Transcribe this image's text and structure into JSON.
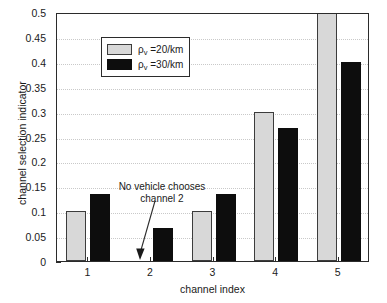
{
  "chart_data": {
    "type": "bar",
    "title": "",
    "xlabel": "channel index",
    "ylabel": "channel selection indicator",
    "categories": [
      "1",
      "2",
      "3",
      "4",
      "5"
    ],
    "series": [
      {
        "name": "rho_v =20/km",
        "values": [
          0.1,
          0.0,
          0.1,
          0.3,
          0.5
        ],
        "color": "#d8d8d8"
      },
      {
        "name": "rho_v =30/km",
        "values": [
          0.135,
          0.067,
          0.135,
          0.267,
          0.4
        ],
        "color": "#0d0d0d"
      }
    ],
    "ylim": [
      0,
      0.5
    ],
    "yticks": [
      "0",
      "0.05",
      "0.1",
      "0.15",
      "0.2",
      "0.25",
      "0.3",
      "0.35",
      "0.4",
      "0.45",
      "0.5"
    ],
    "ytick_values": [
      0,
      0.05,
      0.1,
      0.15,
      0.2,
      0.25,
      0.3,
      0.35,
      0.4,
      0.45,
      0.5
    ],
    "grid": true,
    "legend_position": "upper left",
    "annotations": [
      {
        "text_line1": "No vehicle chooses",
        "text_line2": "channel 2",
        "points_to_category": "2"
      }
    ]
  },
  "legend": {
    "items": [
      {
        "symbol": "ρ",
        "subscript": "v",
        "value": " =20/km"
      },
      {
        "symbol": "ρ",
        "subscript": "v",
        "value": " =30/km"
      }
    ]
  },
  "annotation": {
    "line1": "No vehicle chooses",
    "line2": "channel 2"
  },
  "colors": {
    "series_low_density": "#d8d8d8",
    "series_high_density": "#0d0d0d",
    "axis": "#2b2b2b",
    "grid": "#c9c9c9",
    "background": "#ffffff"
  }
}
